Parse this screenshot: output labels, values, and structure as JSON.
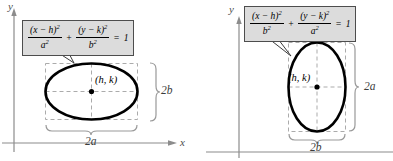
{
  "colors": {
    "axis": "#8c8c8c",
    "ellipse_stroke": "#000000",
    "dashed_guide": "#ababab",
    "brace": "#999999",
    "equation_box_fill": "#dcdcdc",
    "equation_box_border": "#4d4d4d"
  },
  "panels": [
    {
      "id": "ellipse-horizontal-major-axis",
      "axis_x_label": "x",
      "axis_y_label": "y",
      "center_label": "(h, k)",
      "width_label": "2a",
      "height_label": "2b",
      "equation": {
        "num1_base": "(x − h)",
        "num1_exp": "2",
        "den1_base": "a",
        "den1_exp": "2",
        "plus": "+",
        "num2_base": "(y − k)",
        "num2_exp": "2",
        "den2_base": "b",
        "den2_exp": "2",
        "equals": "=",
        "rhs": "1"
      }
    },
    {
      "id": "ellipse-vertical-major-axis",
      "axis_y_label": "y",
      "center_label": "(h, k)",
      "width_label": "2b",
      "height_label": "2a",
      "equation": {
        "num1_base": "(x − h)",
        "num1_exp": "2",
        "den1_base": "b",
        "den1_exp": "2",
        "plus": "+",
        "num2_base": "(y − k)",
        "num2_exp": "2",
        "den2_base": "a",
        "den2_exp": "2",
        "equals": "=",
        "rhs": "1"
      }
    }
  ]
}
